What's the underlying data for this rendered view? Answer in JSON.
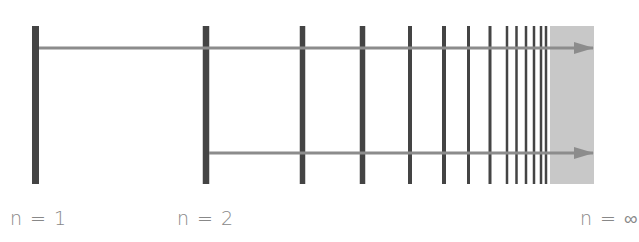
{
  "diagram": {
    "colors": {
      "bar": "#444444",
      "arrow": "#8c8c8c",
      "continuum": "#c8c8c8",
      "label": "#888888"
    },
    "levels": [
      {
        "x": 35.5,
        "width": 7
      },
      {
        "x": 206,
        "width": 6.5
      },
      {
        "x": 302.5,
        "width": 5.5
      },
      {
        "x": 362.5,
        "width": 5.5
      },
      {
        "x": 410,
        "width": 4
      },
      {
        "x": 444,
        "width": 4
      },
      {
        "x": 468.5,
        "width": 3
      },
      {
        "x": 490,
        "width": 3
      },
      {
        "x": 507,
        "width": 2.5
      },
      {
        "x": 516.5,
        "width": 2.5
      },
      {
        "x": 526,
        "width": 2.5
      },
      {
        "x": 534,
        "width": 2.5
      },
      {
        "x": 541,
        "width": 2.5
      },
      {
        "x": 546,
        "width": 2.5
      }
    ],
    "level_top": 26,
    "level_bottom": 184,
    "continuum": {
      "x": 550,
      "y": 26,
      "width": 44,
      "height": 158
    },
    "arrows": [
      {
        "from_level": "n = 1",
        "x1": 39,
        "x2": 593,
        "y": 48
      },
      {
        "from_level": "n = 2",
        "x1": 209,
        "x2": 593,
        "y": 153
      }
    ],
    "labels": [
      {
        "text": "n = 1",
        "x": 10
      },
      {
        "text": "n = 2",
        "x": 177
      },
      {
        "text": "n = ∞",
        "x": 580
      }
    ]
  }
}
